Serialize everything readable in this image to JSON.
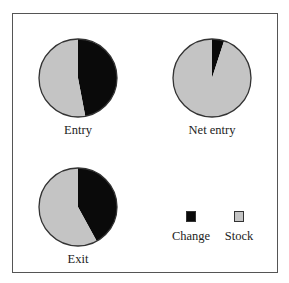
{
  "chart_data": {
    "type": "pie",
    "title": "",
    "legend": {
      "position": "bottom-right",
      "entries": [
        {
          "name": "Change",
          "color": "#0a0a0a"
        },
        {
          "name": "Stock",
          "color": "#c4c4c4"
        }
      ]
    },
    "charts": [
      {
        "label": "Entry",
        "slices": [
          {
            "name": "Change",
            "value": 47
          },
          {
            "name": "Stock",
            "value": 53
          }
        ]
      },
      {
        "label": "Net entry",
        "slices": [
          {
            "name": "Change",
            "value": 5
          },
          {
            "name": "Stock",
            "value": 95
          }
        ]
      },
      {
        "label": "Exit",
        "slices": [
          {
            "name": "Change",
            "value": 42
          },
          {
            "name": "Stock",
            "value": 58
          }
        ]
      }
    ],
    "units": "percent (estimated)"
  },
  "labels": {
    "entry": "Entry",
    "net_entry": "Net entry",
    "exit": "Exit",
    "change": "Change",
    "stock": "Stock"
  },
  "colors": {
    "change": "#0a0a0a",
    "stock": "#c4c4c4",
    "outline": "#333333"
  }
}
